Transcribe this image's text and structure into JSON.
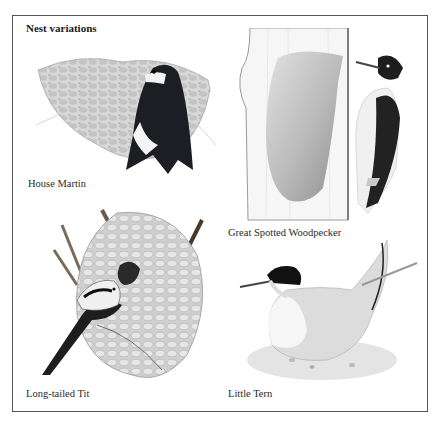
{
  "page": {
    "title": "Nest variations",
    "plates": [
      {
        "id": "house-martin",
        "caption": "House Martin"
      },
      {
        "id": "great-spotted-woodpecker",
        "caption": "Great Spotted Woodpecker"
      },
      {
        "id": "long-tailed-tit",
        "caption": "Long-tailed Tit"
      },
      {
        "id": "little-tern",
        "caption": "Little Tern"
      }
    ]
  },
  "colors": {
    "frame": "#555555",
    "background": "#ffffff",
    "ink": "#222222"
  }
}
